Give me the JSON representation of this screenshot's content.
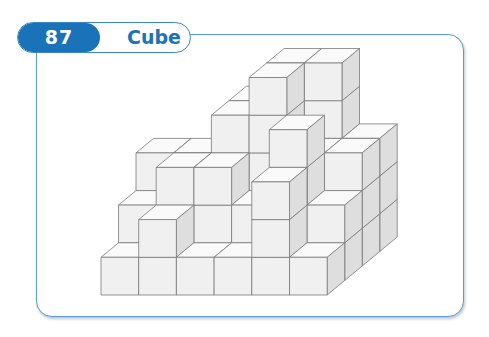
{
  "header": {
    "number": "87",
    "title": "Cube"
  },
  "figure": {
    "colors": {
      "accent": "#1a73b8",
      "frame": "#5a9ccf",
      "front": "#f0f0f0",
      "top": "#fafafa",
      "side": "#dedede",
      "edge": "#7a7a7a"
    },
    "heights": [
      [
        1,
        2,
        1,
        1,
        3,
        1
      ],
      [
        2,
        3,
        3,
        2,
        4,
        2
      ],
      [
        3,
        3,
        4,
        5,
        3,
        3
      ],
      [
        1,
        2,
        4,
        5,
        5,
        3
      ]
    ]
  }
}
